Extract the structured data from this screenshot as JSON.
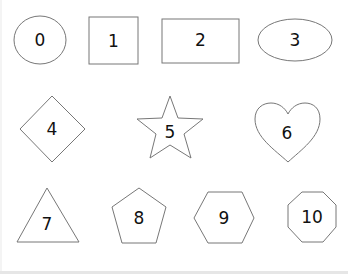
{
  "shapes": [
    {
      "id": "circle",
      "label": "0"
    },
    {
      "id": "square",
      "label": "1"
    },
    {
      "id": "rectangle",
      "label": "2"
    },
    {
      "id": "ellipse",
      "label": "3"
    },
    {
      "id": "diamond",
      "label": "4"
    },
    {
      "id": "star",
      "label": "5"
    },
    {
      "id": "heart",
      "label": "6"
    },
    {
      "id": "triangle",
      "label": "7"
    },
    {
      "id": "pentagon",
      "label": "8"
    },
    {
      "id": "hexagon",
      "label": "9"
    },
    {
      "id": "octagon",
      "label": "10"
    }
  ],
  "colors": {
    "stroke": "#777777",
    "text": "#111111",
    "background": "#ffffff"
  }
}
